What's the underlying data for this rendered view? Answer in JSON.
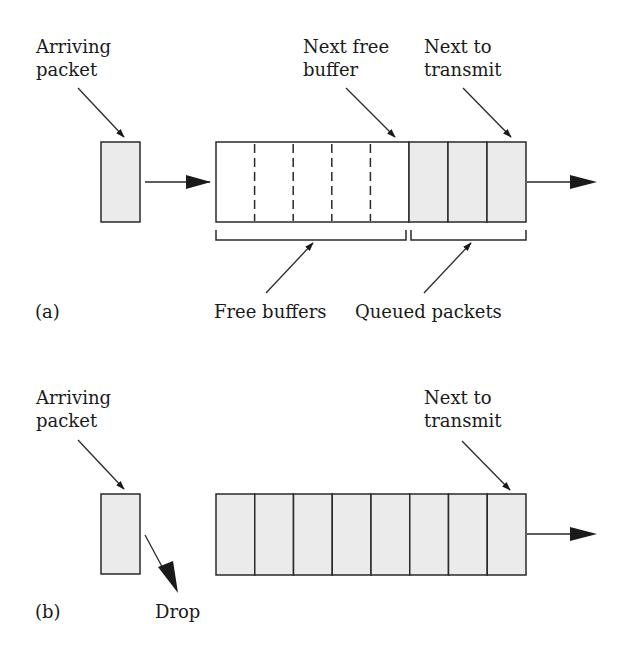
{
  "panel_a": {
    "tag": "(a)",
    "arriving_label": [
      "Arriving",
      "packet"
    ],
    "next_free_label": [
      "Next free",
      "buffer"
    ],
    "next_transmit_label": [
      "Next to",
      "transmit"
    ],
    "free_buffers_label": "Free buffers",
    "queued_packets_label": "Queued packets",
    "free_slots": 5,
    "queued_slots": 3
  },
  "panel_b": {
    "tag": "(b)",
    "arriving_label": [
      "Arriving",
      "packet"
    ],
    "next_transmit_label": [
      "Next to",
      "transmit"
    ],
    "drop_label": "Drop",
    "queued_slots": 8
  },
  "colors": {
    "packet_fill": "#ebebeb",
    "stroke": "#2a2a2a",
    "background": "#ffffff"
  }
}
